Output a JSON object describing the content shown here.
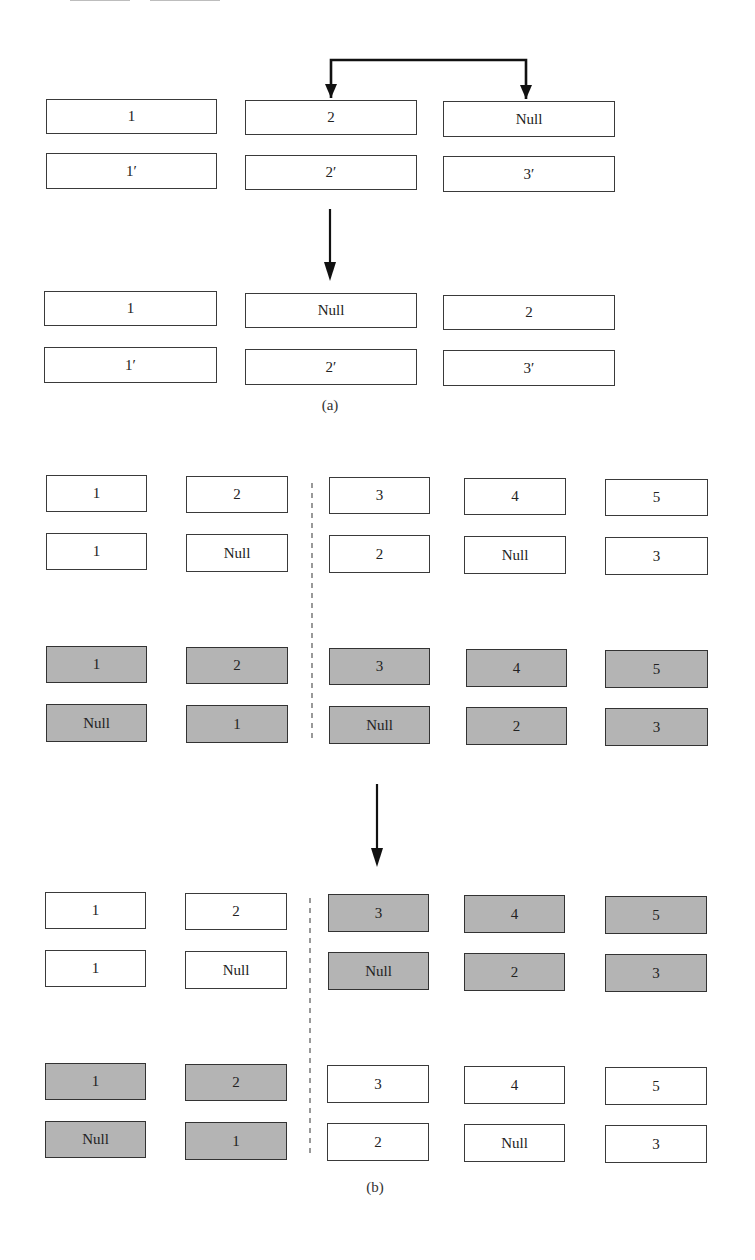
{
  "figure": {
    "part_a": {
      "caption": "(a)",
      "before": {
        "row_top": [
          "1",
          "2",
          "Null"
        ],
        "row_bottom": [
          "1′",
          "2′",
          "3′"
        ]
      },
      "after": {
        "row_top": [
          "1",
          "Null",
          "2"
        ],
        "row_bottom": [
          "1′",
          "2′",
          "3′"
        ]
      },
      "swap_arrow": "swap between column 2 and column 3",
      "transition_arrow": "down"
    },
    "part_b": {
      "caption": "(b)",
      "before": {
        "white_group": {
          "row_top": [
            "1",
            "2",
            "3",
            "4",
            "5"
          ],
          "row_bottom": [
            "1",
            "Null",
            "2",
            "Null",
            "3"
          ]
        },
        "gray_group": {
          "row_top": [
            "1",
            "2",
            "3",
            "4",
            "5"
          ],
          "row_bottom": [
            "Null",
            "1",
            "Null",
            "2",
            "3"
          ]
        }
      },
      "after": {
        "upper_group": {
          "row_top": [
            "1",
            "2",
            "3",
            "4",
            "5"
          ],
          "row_bottom": [
            "1",
            "Null",
            "Null",
            "2",
            "3"
          ],
          "shading": [
            "white",
            "white",
            "gray",
            "gray",
            "gray"
          ]
        },
        "lower_group": {
          "row_top": [
            "1",
            "2",
            "3",
            "4",
            "5"
          ],
          "row_bottom": [
            "Null",
            "1",
            "2",
            "Null",
            "3"
          ],
          "shading": [
            "gray",
            "gray",
            "white",
            "white",
            "white"
          ]
        }
      },
      "transition_arrow": "down",
      "divider": "dashed vertical line between column 2 and column 3"
    },
    "colors": {
      "box_border": "#3a3a3a",
      "box_fill_white": "#ffffff",
      "box_fill_gray": "#b4b4b4",
      "arrow": "#111111"
    }
  }
}
